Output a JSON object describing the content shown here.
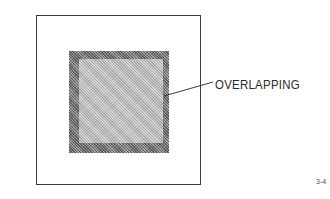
{
  "diagram": {
    "callout_label": "OVERLAPPING",
    "figure_number": "3-4",
    "colors": {
      "frame": "#3a3a3a",
      "overlap_band": "#8e8e8e",
      "inner_fill": "#c4c4c4",
      "leader_line": "#3a3a3a",
      "text": "#2a2a2a"
    }
  }
}
